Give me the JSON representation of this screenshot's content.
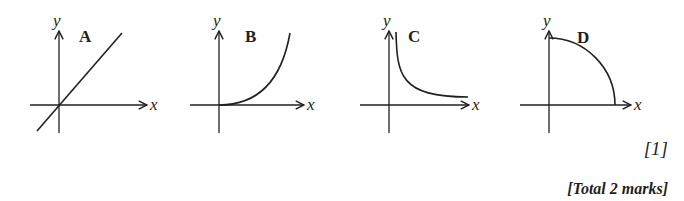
{
  "figure": {
    "graphs": [
      {
        "label": "A",
        "x_axis_label": "x",
        "y_axis_label": "y",
        "shape": "straight line through origin, positive gradient"
      },
      {
        "label": "B",
        "x_axis_label": "x",
        "y_axis_label": "y",
        "shape": "curve starting at origin, increasing gradient"
      },
      {
        "label": "C",
        "x_axis_label": "x",
        "y_axis_label": "y",
        "shape": "decreasing curve approaching x-axis (inverse)"
      },
      {
        "label": "D",
        "x_axis_label": "x",
        "y_axis_label": "y",
        "shape": "quarter-circle-like curve from y-axis to x-axis"
      }
    ]
  },
  "marks": {
    "question_mark": "[1]",
    "total": "[Total 2 marks]"
  },
  "colors": {
    "ink": "#231f20",
    "background": "#ffffff"
  }
}
